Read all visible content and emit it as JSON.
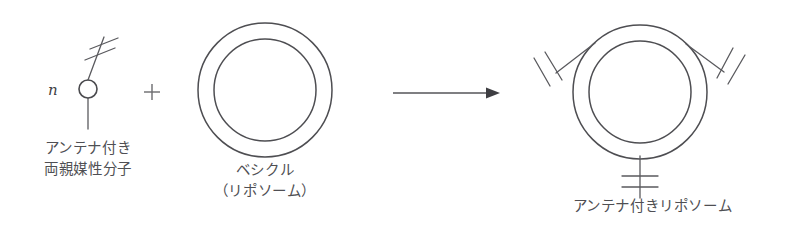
{
  "figure": {
    "background_color": "#ffffff",
    "line_color": "#5a5a5e",
    "text_color": "#4f4f53"
  },
  "left_group": {
    "stoichiometry_label": "n",
    "icon_name": "antenna-amphiphile-icon",
    "caption_line1": "アンテナ付き",
    "caption_line2": "両親媒性分子",
    "caption": "アンテナ付き\n両親媒性分子"
  },
  "operator": {
    "symbol": "+",
    "name": "plus-operator"
  },
  "middle_group": {
    "icon_name": "vesicle-icon",
    "caption_line1": "ベシクル",
    "caption_line2": "（リポソーム）",
    "caption": "ベシクル\n（リポソーム）"
  },
  "arrow": {
    "name": "reaction-arrow",
    "direction": "right",
    "label": ""
  },
  "right_group": {
    "icon_name": "antenna-liposome-icon",
    "antenna_count": 3,
    "antenna_positions": [
      "upper-left",
      "upper-right",
      "bottom"
    ],
    "caption": "アンテナ付きリポソーム"
  }
}
